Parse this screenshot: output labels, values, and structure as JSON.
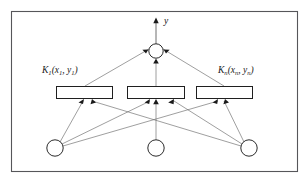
{
  "figure": {
    "background_color": "#ffffff",
    "frame_color": "#56565a",
    "edge_color": "#6a6a6a",
    "node_stroke_color": "#2b2b2b",
    "labels": {
      "output": "y",
      "kernel_left_main": "K",
      "kernel_left_sub": "1",
      "kernel_left_args": "(x",
      "kernel_left_arg1_sub": "1",
      "kernel_left_comma": ", y",
      "kernel_left_arg2_sub": "1",
      "kernel_left_close": ")",
      "kernel_right_main": "K",
      "kernel_right_sub": "n",
      "kernel_right_args": "(x",
      "kernel_right_arg1_sub": "n",
      "kernel_right_comma": ", y",
      "kernel_right_arg2_sub": "n",
      "kernel_right_close": ")"
    },
    "kernel_label_left_full": "K1(x1 , y1)",
    "kernel_label_right_full": "Kn(xn , yn)",
    "output_arrow_label": "y",
    "nodes": {
      "output_node": {
        "cx": 156,
        "cy": 51,
        "r": 7.2
      },
      "input_nodes": [
        {
          "name": "input-node-1",
          "cx": 55,
          "cy": 148,
          "r": 8.2
        },
        {
          "name": "input-node-2",
          "cx": 156,
          "cy": 148,
          "r": 8.2
        },
        {
          "name": "input-node-3",
          "cx": 249,
          "cy": 148,
          "r": 8.2
        }
      ]
    },
    "kernel_boxes": [
      {
        "name": "kernel-box-left",
        "x": 56,
        "y": 86,
        "w": 57,
        "h": 13
      },
      {
        "name": "kernel-box-middle",
        "x": 127,
        "y": 86,
        "w": 58,
        "h": 13
      },
      {
        "name": "kernel-box-right",
        "x": 196,
        "y": 86,
        "w": 57,
        "h": 13
      }
    ],
    "frame": {
      "x": 11,
      "y": 11,
      "w": 287,
      "h": 161
    }
  }
}
